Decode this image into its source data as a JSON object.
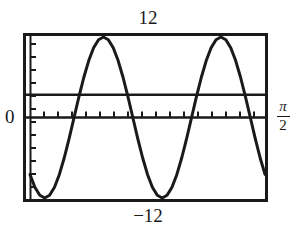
{
  "figure": {
    "name": "graphing-calculator-plot",
    "labels": {
      "top": "12",
      "bottom": "−12",
      "left": "0",
      "right_numerator": "π",
      "right_denominator": "2"
    },
    "colors": {
      "frame": "#1a1a1a",
      "curve": "#1a1a1a",
      "axis": "#1a1a1a",
      "reference_line": "#1a1a1a",
      "background": "#ffffff",
      "text": "#1a1a1a"
    }
  },
  "chart_data": {
    "type": "line",
    "title": "",
    "xlabel": "",
    "ylabel": "",
    "xlim": [
      0,
      1.5707963
    ],
    "ylim": [
      -12,
      12
    ],
    "grid": false,
    "legend": null,
    "axis_labels": {
      "y_max": "12",
      "y_min": "−12",
      "y_zero": "0",
      "x_max": "π/2"
    },
    "ticks": {
      "x_count": 17,
      "y_count": 12,
      "x_axis_at_y": 0,
      "y_axis_at_x": 0
    },
    "series": [
      {
        "name": "sinusoid",
        "kind": "line",
        "amplitude": 12,
        "description": "sinusoid spanning -12 to 12, troughs touching lower frame, peak touching upper frame",
        "x": [
          0.0,
          0.0327,
          0.0654,
          0.0982,
          0.1309,
          0.1636,
          0.1963,
          0.2291,
          0.2618,
          0.2945,
          0.3272,
          0.36,
          0.3927,
          0.4254,
          0.4581,
          0.4909,
          0.5236,
          0.5563,
          0.589,
          0.6218,
          0.6545,
          0.6872,
          0.7199,
          0.7527,
          0.7854,
          0.8181,
          0.8508,
          0.8836,
          0.9163,
          0.949,
          0.9817,
          1.0145,
          1.0472,
          1.0799,
          1.1126,
          1.1454,
          1.1781,
          1.2108,
          1.2435,
          1.2763,
          1.309,
          1.3417,
          1.3744,
          1.4072,
          1.4399,
          1.4726,
          1.5053,
          1.5381,
          1.5708
        ],
        "y": [
          -8.49,
          -10.39,
          -11.59,
          -12.0,
          -11.59,
          -10.39,
          -8.49,
          -6.0,
          -3.11,
          0.0,
          3.11,
          6.0,
          8.49,
          10.39,
          11.59,
          12.0,
          11.59,
          10.39,
          8.49,
          6.0,
          3.11,
          0.0,
          -3.11,
          -6.0,
          -8.49,
          -10.39,
          -11.59,
          -12.0,
          -11.59,
          -10.39,
          -8.49,
          -6.0,
          -3.11,
          0.0,
          3.11,
          6.0,
          8.49,
          10.39,
          11.59,
          12.0,
          11.59,
          10.39,
          8.49,
          6.0,
          3.11,
          0.0,
          -3.11,
          -6.0,
          -8.49
        ]
      },
      {
        "name": "reference-line",
        "kind": "horizontal-line",
        "y_value": 3.4,
        "description": "solid horizontal reference line above the x-axis"
      },
      {
        "name": "x-axis",
        "kind": "horizontal-line",
        "y_value": 0,
        "description": "x-axis with tick marks"
      }
    ],
    "annotations": [
      {
        "text": "12",
        "position": "above-frame-center"
      },
      {
        "text": "−12",
        "position": "below-frame-center"
      },
      {
        "text": "0",
        "position": "left-of-frame-at-y-zero"
      },
      {
        "text": "π/2",
        "position": "right-of-frame-at-y-zero"
      }
    ]
  }
}
